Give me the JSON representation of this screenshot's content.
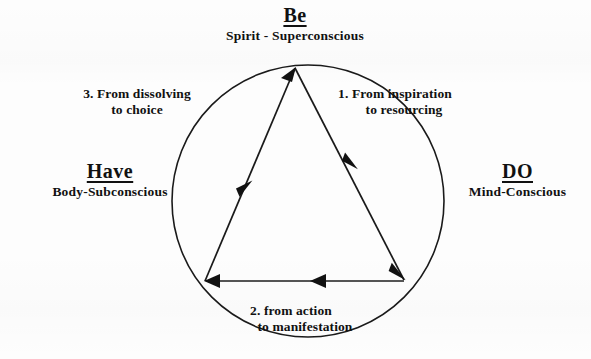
{
  "diagram": {
    "title_vertices": {
      "top": {
        "heading": "Be",
        "subtitle": "Spirit - Superconscious"
      },
      "left": {
        "heading": "Have",
        "subtitle": "Body-Subconscious"
      },
      "right": {
        "heading": "DO",
        "subtitle": "Mind-Conscious"
      }
    },
    "steps": [
      {
        "id": "step-1",
        "line1": "1. From inspiration",
        "line2": "to resourcing"
      },
      {
        "id": "step-2",
        "line1": "2. from action",
        "line2": "to manifestation"
      },
      {
        "id": "step-3",
        "line1": "3. From dissolving",
        "line2": "to choice"
      }
    ],
    "colors": {
      "ink": "#111111",
      "background": "#fdfdfd",
      "stroke": "#1a1a1a"
    }
  }
}
